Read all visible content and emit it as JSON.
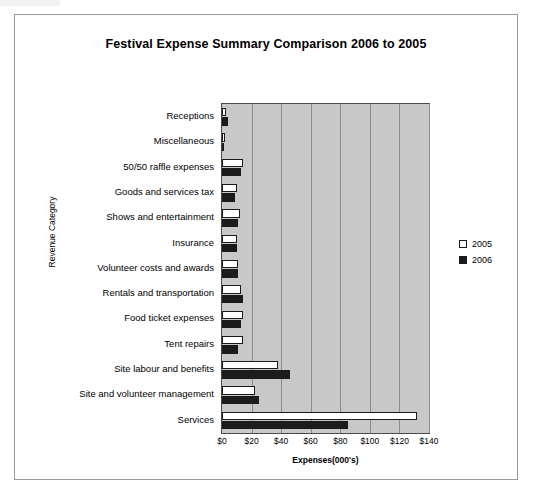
{
  "chart_data": {
    "type": "bar",
    "title": "Festival Expense Summary Comparison 2006 to 2005",
    "xlabel": "Expenses(000's)",
    "ylabel": "Revenue Category",
    "orientation": "horizontal",
    "xlim": [
      0,
      140
    ],
    "xticks": [
      "$0",
      "$20",
      "$40",
      "$60",
      "$80",
      "$100",
      "$120",
      "$140"
    ],
    "xtick_values": [
      0,
      20,
      40,
      60,
      80,
      100,
      120,
      140
    ],
    "grid": true,
    "legend_position": "right",
    "categories": [
      "Receptions",
      "Miscellaneous",
      "50/50 raffle expenses",
      "Goods and services tax",
      "Shows and entertainment",
      "Insurance",
      "Volunteer costs and awards",
      "Rentals and transportation",
      "Food ticket expenses",
      "Tent repairs",
      "Site labour and benefits",
      "Site and volunteer management",
      "Services"
    ],
    "series": [
      {
        "name": "2005",
        "color": "#ffffff",
        "values": [
          3,
          2,
          14,
          10,
          12,
          10,
          11,
          13,
          14,
          14,
          38,
          22,
          132
        ]
      },
      {
        "name": "2006",
        "color": "#1c1c1c",
        "values": [
          4,
          1,
          13,
          9,
          11,
          10,
          11,
          14,
          13,
          11,
          46,
          25,
          85
        ]
      }
    ]
  },
  "legend": {
    "items": [
      {
        "label": "2005"
      },
      {
        "label": "2006"
      }
    ]
  }
}
